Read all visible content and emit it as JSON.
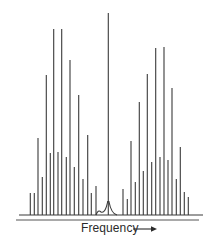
{
  "diagram": {
    "type": "line-spectrum",
    "axis_label": "Frequency",
    "axis_arrow": "→",
    "colors": {
      "line": "#3a3a3a",
      "background": "#ffffff"
    },
    "baseline": {
      "y": 215,
      "x_start": 19,
      "x_end": 203
    },
    "axis_line": {
      "y": 220,
      "x_start": 16,
      "x_end": 199
    },
    "center_peak": {
      "x": 108.3,
      "top": 13,
      "wing_start": 99,
      "wing_end": 117
    }
  },
  "chart_data": {
    "type": "line-spectrum",
    "title": "",
    "xlabel": "Frequency",
    "ylabel": "",
    "left_branch": {
      "x": [
        30.3,
        34.3,
        38,
        42.3,
        46.3,
        50.3,
        53.7,
        58,
        61.7,
        66.3,
        70,
        74.3,
        78.7,
        83,
        87.7,
        91.3,
        96
      ],
      "top_y": [
        193,
        193,
        138,
        177,
        75,
        153,
        29,
        152,
        29,
        157,
        60,
        167,
        95,
        179,
        135,
        193,
        186
      ]
    },
    "center": {
      "x": 108.3,
      "top_y": 13
    },
    "right_branch": {
      "x": [
        123,
        127.3,
        131,
        135.3,
        139.3,
        143.3,
        147.3,
        151.7,
        155.7,
        160,
        164,
        168,
        172,
        176.3,
        180.3,
        184.3,
        188.3
      ],
      "top_y": [
        189,
        199,
        141,
        182,
        102,
        171,
        74,
        162,
        48,
        157,
        47,
        160,
        88,
        179,
        147,
        192,
        197
      ]
    },
    "baseline_y": 215,
    "grid": false,
    "legend": null
  }
}
